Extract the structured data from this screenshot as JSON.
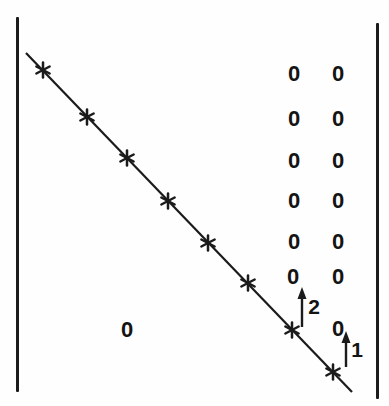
{
  "figure": {
    "type": "matrix-determinant-diagram",
    "delimiter": "vertical-bar",
    "zero_symbol": "0",
    "lower_left_zero": "0",
    "diagonal_marker": "✱",
    "diagonal_marker_count": 8,
    "zero_grid": {
      "columns": 2,
      "second_last_column_zeros": 6,
      "last_column_zeros": 7
    },
    "arrows": [
      {
        "label": "2",
        "direction": "up",
        "column": "second-to-last"
      },
      {
        "label": "1",
        "direction": "up",
        "column": "last"
      }
    ]
  }
}
